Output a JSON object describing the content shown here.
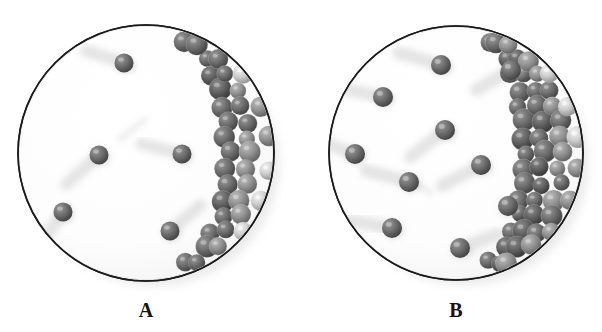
{
  "figure": {
    "background_color": "#ffffff",
    "outline_color": "#1b1b1b",
    "sphere_color": "#6e6e6e",
    "sphere_dark_color": "#4a4a4a",
    "sphere_light_color": "#d8d8d8",
    "shadow_color": "#c9c9c9"
  },
  "panels": [
    {
      "id": "panel-a",
      "label": "A",
      "label_x": 146,
      "label_y": 300,
      "circle": {
        "cx": 146,
        "cy": 153,
        "r": 128
      },
      "free_particle_count": 6,
      "free_particles": [
        {
          "cx": 124,
          "cy": 63,
          "r": 9.5,
          "trail_angle": 18,
          "trail_len": 40
        },
        {
          "cx": 99,
          "cy": 155,
          "r": 9.5,
          "trail_angle": -42,
          "trail_len": 44
        },
        {
          "cx": 182,
          "cy": 154,
          "r": 9.5,
          "trail_angle": 14,
          "trail_len": 42
        },
        {
          "cx": 63,
          "cy": 212,
          "r": 9.5,
          "trail_angle": -55,
          "trail_len": 42
        },
        {
          "cx": 170,
          "cy": 231,
          "r": 9.5,
          "trail_angle": 140,
          "trail_len": 40
        },
        {
          "cx": 146,
          "cy": 119,
          "r": 2.0,
          "trail_angle": -38,
          "trail_len": 34
        }
      ],
      "cluster": {
        "description": "crescent of closely packed spheres along inner right wall",
        "thickness": 42,
        "sphere_count": 34,
        "sphere_radius": 10
      }
    },
    {
      "id": "panel-b",
      "label": "B",
      "label_x": 456,
      "label_y": 300,
      "circle": {
        "cx": 456,
        "cy": 153,
        "r": 127
      },
      "free_particle_count": 11,
      "free_particles": [
        {
          "cx": 441,
          "cy": 65,
          "r": 10,
          "trail_angle": 16,
          "trail_len": 44
        },
        {
          "cx": 511,
          "cy": 70,
          "r": 10,
          "trail_angle": -30,
          "trail_len": 40
        },
        {
          "cx": 383,
          "cy": 97,
          "r": 10,
          "trail_angle": 12,
          "trail_len": 46
        },
        {
          "cx": 445,
          "cy": 130,
          "r": 10,
          "trail_angle": -38,
          "trail_len": 44
        },
        {
          "cx": 355,
          "cy": 154,
          "r": 10,
          "trail_angle": 20,
          "trail_len": 40
        },
        {
          "cx": 409,
          "cy": 182,
          "r": 10,
          "trail_angle": 15,
          "trail_len": 44
        },
        {
          "cx": 481,
          "cy": 165,
          "r": 10,
          "trail_angle": -28,
          "trail_len": 44
        },
        {
          "cx": 508,
          "cy": 206,
          "r": 10,
          "trail_angle": 170,
          "trail_len": 42
        },
        {
          "cx": 392,
          "cy": 228,
          "r": 10,
          "trail_angle": 10,
          "trail_len": 44
        },
        {
          "cx": 460,
          "cy": 248,
          "r": 10,
          "trail_angle": 160,
          "trail_len": 40
        },
        {
          "cx": 431,
          "cy": 193,
          "r": 2,
          "trail_angle": 30,
          "trail_len": 30
        }
      ],
      "cluster": {
        "description": "wider crescent of closely packed spheres along inner right wall",
        "thickness": 56,
        "sphere_count": 46,
        "sphere_radius": 10
      }
    }
  ]
}
